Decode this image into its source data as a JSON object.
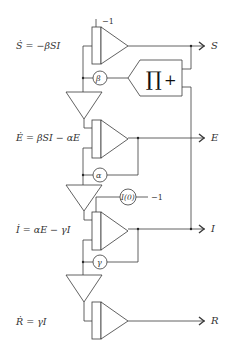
{
  "diagram": {
    "equations": {
      "S": "Ṡ = −βSI",
      "E": "Ė = βSI − αE",
      "I": "İ = αE − γI",
      "R": "Ṙ = γI"
    },
    "outputs": {
      "S": "S",
      "E": "E",
      "I": "I",
      "R": "R"
    },
    "coefficients": {
      "beta": "β",
      "alpha": "α",
      "gamma": "γ",
      "initial_I": "I(0)"
    },
    "constants": {
      "s_initial": "−1",
      "i_initial": "−1"
    },
    "multiplier": {
      "symbol": "∏",
      "sign": "+"
    },
    "colors": {
      "stroke": "#3a3a3a",
      "background": "#ffffff",
      "text": "#333333"
    }
  }
}
